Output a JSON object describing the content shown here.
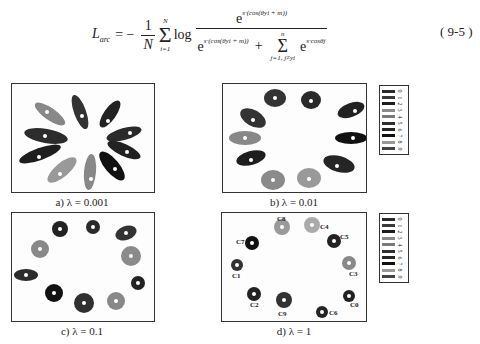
{
  "equation": {
    "lhs": "L",
    "lhs_sub": "arc",
    "equals": "= −",
    "coef_num": "1",
    "coef_den": "N",
    "sum1_top": "N",
    "sum1_bottom": "i=1",
    "log": "log",
    "numerator_base": "e",
    "numerator_exp": "s·(cos(θyi + m))",
    "denominator_base1": "e",
    "denominator_exp1": "s·(cos(θyi + m))",
    "plus": "+",
    "sum2_top": "n",
    "sum2_bottom": "j=1, j≠yi",
    "denominator_base2": "e",
    "denominator_exp2": "s·cosθj",
    "number": "( 9-5 )"
  },
  "figures": [
    {
      "id": "a",
      "caption": "a) λ = 0.001",
      "lambda": 0.001
    },
    {
      "id": "b",
      "caption": "b) λ = 0.01",
      "lambda": 0.01
    },
    {
      "id": "c",
      "caption": "c) λ = 0.1",
      "lambda": 0.1
    },
    {
      "id": "d",
      "caption": "d) λ = 1",
      "lambda": 1
    }
  ],
  "legend": {
    "labels": [
      "0",
      "1",
      "2",
      "3",
      "4",
      "5",
      "6",
      "7",
      "8",
      "9"
    ],
    "colors": [
      "#2a2a2a",
      "#3a3a3a",
      "#1e1e1e",
      "#8a8a8a",
      "#7a7a7a",
      "#303030",
      "#252525",
      "#111111",
      "#999999",
      "#444444"
    ]
  },
  "panel_d_labels": [
    "C8",
    "C4",
    "C7",
    "C5",
    "C1",
    "C3",
    "C2",
    "C9",
    "C0",
    "C6"
  ]
}
